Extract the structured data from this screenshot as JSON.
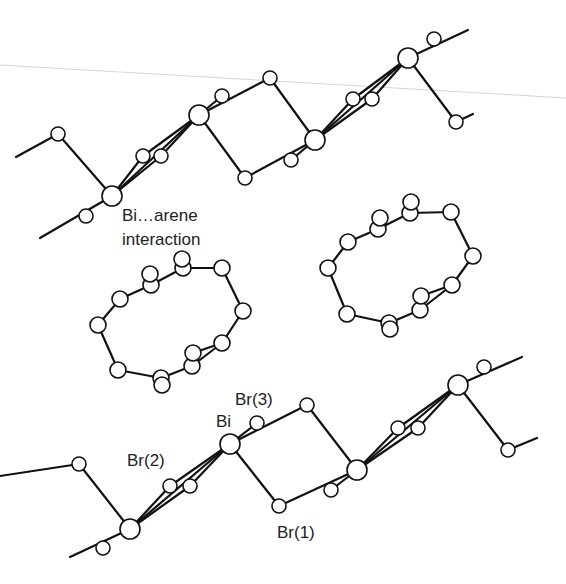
{
  "figure": {
    "colors": {
      "bond": "#111111",
      "atom_fill": "#ffffff",
      "text": "#222222",
      "background": "#ffffff"
    }
  },
  "labels": {
    "interaction_line1": "Bi…arene",
    "interaction_line2": "interaction",
    "bi": "Bi",
    "br1": "Br(1)",
    "br2": "Br(2)",
    "br3": "Br(3)"
  },
  "structure": {
    "components": [
      {
        "name": "upper-bibr-chain",
        "type": "polymer-chain",
        "bismuth_atoms": 4
      },
      {
        "name": "left-arene-ring",
        "type": "arene"
      },
      {
        "name": "right-arene-ring",
        "type": "arene"
      },
      {
        "name": "lower-bibr-chain",
        "type": "polymer-chain",
        "bismuth_atoms": 4
      }
    ]
  }
}
